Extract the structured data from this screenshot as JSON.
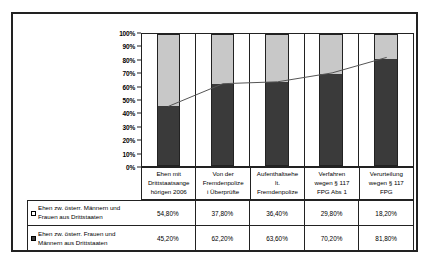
{
  "chart_data": {
    "type": "bar",
    "subtype": "100% stacked column with overlay line",
    "title": "",
    "xlabel": "",
    "ylabel": "",
    "ylim": [
      0,
      100
    ],
    "grid": false,
    "legend_position": "bottom-table",
    "categories": [
      "Ehen mit Drittstaatsange hörigen 2006",
      "Von der Fremdenpolize i Überprüfte",
      "Aufenthaltsehe lt. Fremdenpolize",
      "Verfahren wegen § 117 FPG Abs 1",
      "Verurteilung wegen § 117 FPG"
    ],
    "ytick_labels": [
      "100%",
      "90%",
      "80%",
      "70%",
      "60%",
      "50%",
      "40%",
      "30%",
      "20%",
      "10%",
      "0%"
    ],
    "ytick_values": [
      100,
      90,
      80,
      70,
      60,
      50,
      40,
      30,
      20,
      10,
      0
    ],
    "series": [
      {
        "name": "Ehen zw. österr. Männern und Frauen aus Drittstaaten",
        "color": "#ffffff",
        "marker": "light-swatch",
        "values": [
          54.8,
          37.8,
          36.4,
          29.8,
          18.2
        ],
        "labels": [
          "54,80%",
          "37,80%",
          "36,40%",
          "29,80%",
          "18,20%"
        ]
      },
      {
        "name": "Ehen zw. österr. Frauen und Männern aus Drittstaaten",
        "color": "#3a3a3a",
        "marker": "dark-swatch",
        "values": [
          45.2,
          62.2,
          63.6,
          70.2,
          81.8
        ],
        "labels": [
          "45,20%",
          "62,20%",
          "63,60%",
          "70,20%",
          "81,80%"
        ]
      }
    ],
    "overlay_line": {
      "name": "Anteil Ehen zw. österr. Frauen und Männern aus Drittstaaten",
      "color": "#555555",
      "values": [
        45.2,
        62.2,
        63.6,
        70.2,
        81.8
      ]
    }
  },
  "categories_display": [
    [
      "Ehen mit",
      "Drittstaatsange",
      "hörigen 2006"
    ],
    [
      "Von der",
      "Fremdenpolize",
      "i Überprüfte"
    ],
    [
      "Aufenthaltsehe",
      "lt.",
      "Fremdenpolize"
    ],
    [
      "Verfahren",
      "wegen § 117",
      "FPG Abs 1"
    ],
    [
      "Verurteilung",
      "wegen § 117",
      "FPG"
    ]
  ],
  "legend_rows": [
    {
      "swatch": "light-swatch",
      "line1": "Ehen zw. österr. Männern und",
      "line2": "Frauen aus Drittstaaten",
      "values": [
        "54,80%",
        "37,80%",
        "36,40%",
        "29,80%",
        "18,20%"
      ]
    },
    {
      "swatch": "dark-swatch",
      "line1": "Ehen zw. österr. Frauen und",
      "line2": "Männern aus Drittstaaten",
      "values": [
        "45,20%",
        "62,20%",
        "63,60%",
        "70,20%",
        "81,80%"
      ]
    }
  ],
  "colors": {
    "series_light": "#c8c8c8",
    "series_dark": "#3a3a3a",
    "frame": "#222222",
    "line": "#555555",
    "background": "#ffffff"
  }
}
